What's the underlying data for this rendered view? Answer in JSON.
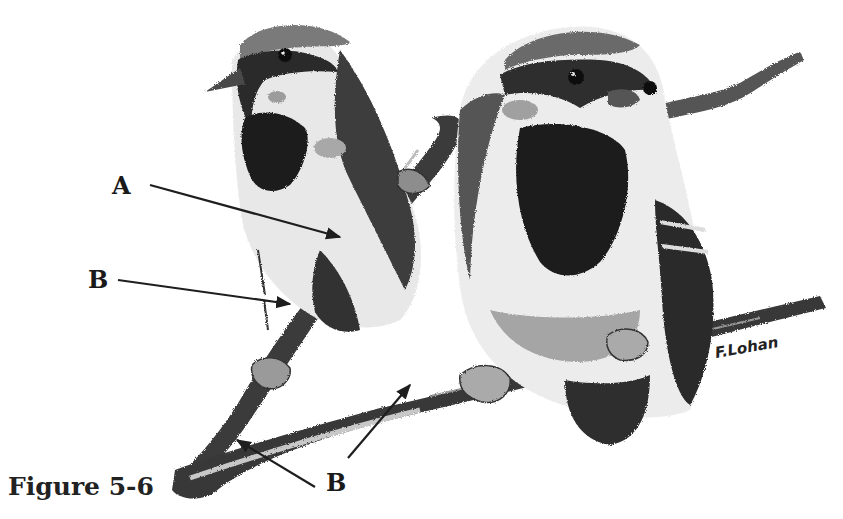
{
  "figure": {
    "caption": "Figure 5-6",
    "signature": "F.Lohan",
    "colors": {
      "ink": "#1e1e1e",
      "dark": "#2a2a2a",
      "mid": "#6e6e6e",
      "light": "#b5b5b5",
      "paper": "#ffffff"
    }
  },
  "labels": [
    {
      "id": "A",
      "text": "A",
      "points_to": "branch behind left bird"
    },
    {
      "id": "B1",
      "text": "B",
      "points_to": "branch below left bird"
    },
    {
      "id": "B2",
      "text": "B",
      "points_to": "lower branch left"
    },
    {
      "id": "B3",
      "text": "B",
      "points_to": "lower branch middle"
    }
  ]
}
